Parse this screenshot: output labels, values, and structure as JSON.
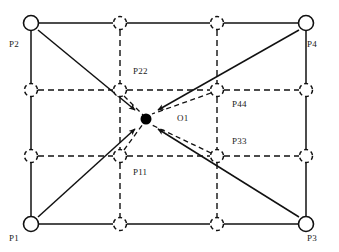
{
  "diagram": {
    "colors": {
      "stroke": "#111111",
      "dash": "#111111",
      "dot": "#000000",
      "background": "#ffffff",
      "text": "#1a1a1a"
    },
    "canvas": {
      "width": 339,
      "height": 252
    },
    "outer_rect": {
      "left": 31,
      "top": 23,
      "right": 306,
      "bottom": 224
    },
    "grid": {
      "x": [
        31,
        120,
        217,
        306
      ],
      "y": [
        23,
        90,
        156,
        224
      ],
      "solid_circle_radius": 7.5,
      "dashed_circle_radius": 6.5
    },
    "center_point": {
      "x": 146,
      "y": 119,
      "radius": 5.5,
      "label": "O1"
    },
    "corner_nodes": [
      {
        "name": "P1",
        "x": 31,
        "y": 224,
        "style": "solid-circle"
      },
      {
        "name": "P2",
        "x": 31,
        "y": 23,
        "style": "solid-circle"
      },
      {
        "name": "P3",
        "x": 306,
        "y": 224,
        "style": "solid-circle"
      },
      {
        "name": "P4",
        "x": 306,
        "y": 23,
        "style": "solid-circle"
      }
    ],
    "inner_nodes": [
      {
        "name": "P11",
        "x": 120,
        "y": 156,
        "style": "dashed-circle"
      },
      {
        "name": "P22",
        "x": 120,
        "y": 90,
        "style": "dashed-circle"
      },
      {
        "name": "P33",
        "x": 217,
        "y": 156,
        "style": "dashed-circle"
      },
      {
        "name": "P44",
        "x": 217,
        "y": 90,
        "style": "dashed-circle"
      }
    ],
    "edge_nodes": [
      {
        "x": 120,
        "y": 23,
        "style": "dashed-circle"
      },
      {
        "x": 217,
        "y": 23,
        "style": "dashed-circle"
      },
      {
        "x": 120,
        "y": 224,
        "style": "dashed-circle"
      },
      {
        "x": 217,
        "y": 224,
        "style": "dashed-circle"
      },
      {
        "x": 31,
        "y": 90,
        "style": "dashed-circle"
      },
      {
        "x": 31,
        "y": 156,
        "style": "dashed-circle"
      },
      {
        "x": 306,
        "y": 90,
        "style": "dashed-circle"
      },
      {
        "x": 306,
        "y": 156,
        "style": "dashed-circle"
      }
    ],
    "arrows": [
      {
        "from": "P2",
        "to": "O1",
        "style": "solid",
        "x1": 38,
        "y1": 30,
        "x2": 139,
        "y2": 113
      },
      {
        "from": "P4",
        "to": "O1",
        "style": "solid",
        "x1": 299,
        "y1": 30,
        "x2": 154,
        "y2": 113
      },
      {
        "from": "P1",
        "to": "O1",
        "style": "solid",
        "x1": 38,
        "y1": 217,
        "x2": 139,
        "y2": 126
      },
      {
        "from": "P3",
        "to": "O1",
        "style": "solid",
        "x1": 299,
        "y1": 217,
        "x2": 154,
        "y2": 126
      },
      {
        "from": "P22",
        "to": "O1",
        "style": "dashed",
        "x1": 123,
        "y1": 95,
        "x2": 142,
        "y2": 114
      },
      {
        "from": "P44",
        "to": "O1",
        "style": "dashed",
        "x1": 213,
        "y1": 94,
        "x2": 151,
        "y2": 114
      },
      {
        "from": "P11",
        "to": "O1",
        "style": "dashed",
        "x1": 123,
        "y1": 151,
        "x2": 142,
        "y2": 125
      },
      {
        "from": "P33",
        "to": "O1",
        "style": "dashed",
        "x1": 213,
        "y1": 152,
        "x2": 151,
        "y2": 125
      }
    ],
    "labels": [
      {
        "id": "P2",
        "text": "P2",
        "x": 9,
        "y": 40
      },
      {
        "id": "P4",
        "text": "P4",
        "x": 307,
        "y": 40
      },
      {
        "id": "P1",
        "text": "P1",
        "x": 9,
        "y": 234
      },
      {
        "id": "P3",
        "text": "P3",
        "x": 307,
        "y": 234
      },
      {
        "id": "P22",
        "text": "P22",
        "x": 133,
        "y": 67
      },
      {
        "id": "P44",
        "text": "P44",
        "x": 232,
        "y": 100
      },
      {
        "id": "P33",
        "text": "P33",
        "x": 232,
        "y": 137
      },
      {
        "id": "P11",
        "text": "P11",
        "x": 133,
        "y": 168
      },
      {
        "id": "O1",
        "text": "O1",
        "x": 177,
        "y": 114
      }
    ]
  }
}
